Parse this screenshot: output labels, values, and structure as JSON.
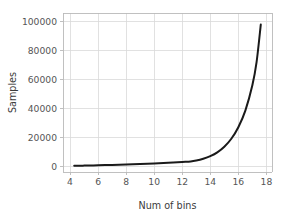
{
  "chart_data": {
    "type": "line",
    "title": "",
    "xlabel": "Num of bins",
    "ylabel": "Samples",
    "xlim": [
      3.5,
      18.4
    ],
    "ylim": [
      -4000,
      106000
    ],
    "grid": true,
    "legend": null,
    "xticks": [
      4,
      6,
      8,
      10,
      12,
      14,
      16,
      18
    ],
    "xtick_labels": [
      "4",
      "6",
      "8",
      "10",
      "12",
      "14",
      "16",
      "18"
    ],
    "yticks": [
      0,
      20000,
      40000,
      60000,
      80000,
      100000
    ],
    "ytick_labels": [
      "0",
      "20000",
      "40000",
      "60000",
      "80000",
      "100000"
    ],
    "series": [
      {
        "name": "samples",
        "color": "#1a1a1a",
        "linewidth": 2.0,
        "x": [
          4.3,
          5.0,
          6.0,
          7.0,
          8.0,
          9.0,
          10.0,
          11.0,
          12.0,
          12.6,
          13.0,
          13.5,
          14.0,
          14.5,
          15.0,
          15.5,
          16.0,
          16.5,
          17.0,
          17.3,
          17.6
        ],
        "y": [
          300,
          420,
          650,
          900,
          1200,
          1550,
          1950,
          2400,
          2900,
          3250,
          3900,
          5200,
          7000,
          9600,
          13500,
          19000,
          27000,
          38500,
          56000,
          72000,
          98000
        ]
      }
    ]
  },
  "axis_labels": {
    "x_title": "Num of bins",
    "y_title": "Samples"
  },
  "colors": {
    "line": "#1a1a1a",
    "grid": "#d9d9d9",
    "spine": "#b9b9b9",
    "tick_text": "#555555",
    "background": "#ffffff"
  }
}
